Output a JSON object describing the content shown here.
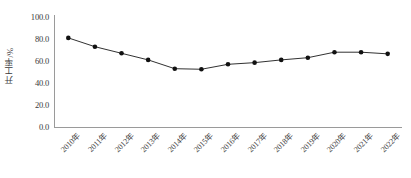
{
  "chart_data": {
    "type": "line",
    "title": "",
    "xlabel": "",
    "ylabel": "开工率/%",
    "categories": [
      "2010年",
      "2011年",
      "2012年",
      "2013年",
      "2014年",
      "2015年",
      "2016年",
      "2017年",
      "2018年",
      "2019年",
      "2020年",
      "2021年",
      "2022年"
    ],
    "values": [
      81.0,
      73.0,
      67.0,
      61.0,
      53.0,
      52.5,
      57.0,
      58.5,
      61.0,
      63.0,
      68.0,
      68.0,
      66.5
    ],
    "series": [
      {
        "name": "开工率",
        "values": [
          81.0,
          73.0,
          67.0,
          61.0,
          53.0,
          52.5,
          57.0,
          58.5,
          61.0,
          63.0,
          68.0,
          68.0,
          66.5
        ]
      }
    ],
    "ylim": [
      0.0,
      100.0
    ],
    "yticks": [
      0.0,
      20.0,
      40.0,
      60.0,
      80.0,
      100.0
    ],
    "ytick_labels": [
      "0.0",
      "20.0",
      "40.0",
      "60.0",
      "80.0",
      "100.0"
    ],
    "grid": false,
    "legend": null,
    "legend_position": "none",
    "marker": "circle",
    "line_color": "#1a1a1a",
    "marker_color": "#111111",
    "axis_color": "#9a9a9a",
    "background_color": "#ffffff"
  }
}
